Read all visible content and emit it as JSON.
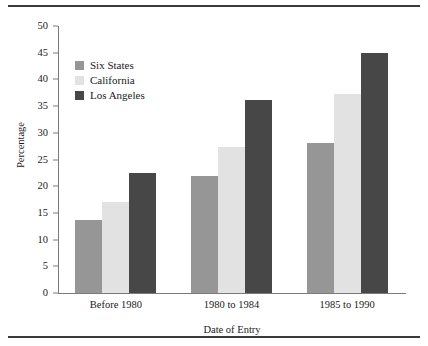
{
  "chart_data": {
    "type": "bar",
    "title": "",
    "xlabel": "Date of Entry",
    "ylabel": "Percentage",
    "categories": [
      "Before 1980",
      "1980 to 1984",
      "1985 to 1990"
    ],
    "series": [
      {
        "name": "Six States",
        "values": [
          13.7,
          22.0,
          28.0
        ],
        "color": "#969696"
      },
      {
        "name": "California",
        "values": [
          17.1,
          27.3,
          37.2
        ],
        "color": "#e2e2e2"
      },
      {
        "name": "Los Angeles",
        "values": [
          22.5,
          36.2,
          45.0
        ],
        "color": "#474747"
      }
    ],
    "ylim": [
      0,
      50
    ],
    "yticks": [
      0,
      5,
      10,
      15,
      20,
      25,
      30,
      35,
      40,
      45,
      50
    ],
    "ytick_labels": [
      "0",
      "5",
      "10",
      "15",
      "20",
      "25",
      "30",
      "35",
      "40",
      "45",
      "50"
    ],
    "grid": false,
    "legend_position": "upper left",
    "axis_color": "#7a7a7a",
    "frame_color": "#3a3a3a",
    "background": "#ffffff"
  }
}
